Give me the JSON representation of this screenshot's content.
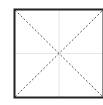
{
  "diagram": {
    "shape": "square-with-diagonals-and-centerlines",
    "box": {
      "x": 14.5,
      "y": 9.5,
      "width": 89,
      "height": 88
    },
    "colors": {
      "border": "#222222",
      "diagonal": "#555555",
      "centerline": "#cccccc",
      "background": "#ffffff"
    }
  }
}
